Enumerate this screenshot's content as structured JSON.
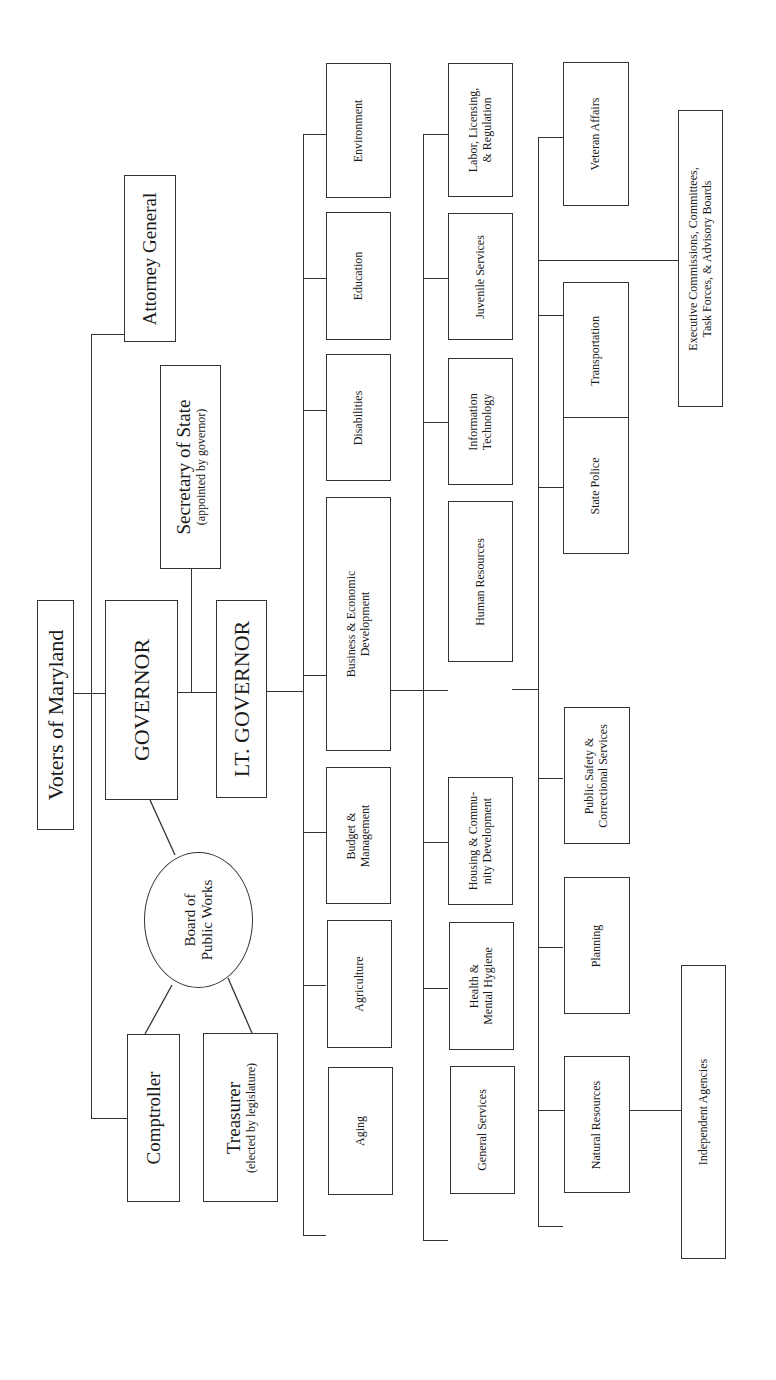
{
  "orientation": "rotated-90-ccw",
  "top": {
    "voters": "Voters of Maryland",
    "governor": "GOVERNOR",
    "lt_governor": "LT. GOVERNOR"
  },
  "officers": {
    "attorney_general": "Attorney General",
    "secretary_of_state": {
      "label": "Secretary of State",
      "note": "(appointed by governor)"
    },
    "board_of_public_works": {
      "line1": "Board of",
      "line2": "Public Works"
    },
    "comptroller": "Comptroller",
    "treasurer": {
      "label": "Treasurer",
      "note": "(elected by legislature)"
    }
  },
  "departments": {
    "column1": [
      {
        "line1": "Environment"
      },
      {
        "line1": "Education"
      },
      {
        "line1": "Disabilities"
      },
      {
        "line1": "Business & Economic",
        "line2": "Development"
      },
      {
        "line1": "Budget &",
        "line2": "Management"
      },
      {
        "line1": "Agriculture"
      },
      {
        "line1": "Aging"
      }
    ],
    "column2": [
      {
        "line1": "Labor, Licensing,",
        "line2": "& Regulation"
      },
      {
        "line1": "Juvenile Services"
      },
      {
        "line1": "Information",
        "line2": "Technology"
      },
      {
        "line1": "Human Resources"
      },
      {
        "line1": "Housing & Commu-",
        "line2": "nity Development"
      },
      {
        "line1": "Health &",
        "line2": "Mental Hygiene"
      },
      {
        "line1": "General Services"
      }
    ],
    "column3": [
      {
        "line1": "Veteran Affairs"
      },
      {
        "line1": "Transportation"
      },
      {
        "line1": "State Police"
      },
      {
        "line1": "Public Safety &",
        "line2": "Correctional Services"
      },
      {
        "line1": "Planning"
      },
      {
        "line1": "Natural Resources"
      }
    ]
  },
  "other": {
    "executive_commissions": {
      "line1": "Executive Commissions, Committees,",
      "line2": "Task Forces, & Advisory Boards"
    },
    "independent_agencies": "Independent Agencies"
  }
}
